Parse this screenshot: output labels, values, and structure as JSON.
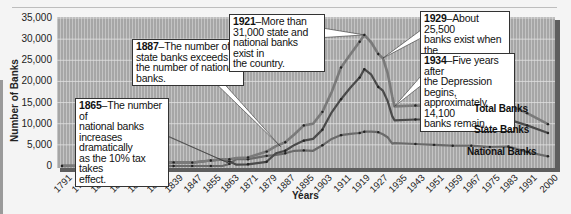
{
  "chart_data": {
    "type": "line",
    "title": "",
    "xlabel": "Years",
    "ylabel": "Number of Banks",
    "ylim": [
      0,
      35000
    ],
    "yticks": [
      "0",
      "5,000",
      "10,000",
      "15,000",
      "20,000",
      "25,000",
      "30,000",
      "35,000"
    ],
    "xticks": [
      "1791",
      "1799",
      "1807",
      "1815",
      "1823",
      "1831",
      "1839",
      "1847",
      "1855",
      "1863",
      "1871",
      "1879",
      "1887",
      "1895",
      "1903",
      "1911",
      "1919",
      "1927",
      "1935",
      "1943",
      "1951",
      "1959",
      "1967",
      "1975",
      "1983",
      "1991",
      "2000"
    ],
    "grid": true,
    "x": [
      1791,
      1799,
      1807,
      1815,
      1823,
      1831,
      1839,
      1847,
      1855,
      1860,
      1863,
      1866,
      1871,
      1879,
      1883,
      1887,
      1891,
      1895,
      1899,
      1903,
      1907,
      1911,
      1915,
      1919,
      1921,
      1924,
      1927,
      1929,
      1931,
      1933,
      1934,
      1943,
      1951,
      1959,
      1967,
      1975,
      1983,
      1991,
      2000
    ],
    "series": [
      {
        "name": "Total Banks",
        "values": [
          20,
          50,
          150,
          250,
          330,
          500,
          850,
          800,
          1300,
          1550,
          1600,
          1900,
          2000,
          3400,
          4700,
          5600,
          7500,
          9600,
          10000,
          12800,
          17500,
          23300,
          26400,
          29400,
          31000,
          29200,
          26500,
          25500,
          22000,
          16500,
          14100,
          14300,
          14200,
          14100,
          14200,
          14600,
          14500,
          12500,
          9900
        ]
      },
      {
        "name": "State Banks",
        "values": [
          20,
          50,
          150,
          250,
          330,
          500,
          850,
          800,
          1300,
          1550,
          1100,
          300,
          400,
          1000,
          3000,
          3600,
          5000,
          6000,
          6400,
          8600,
          12700,
          15800,
          18500,
          20900,
          22900,
          21600,
          18700,
          17800,
          15400,
          11800,
          10800,
          11000,
          11000,
          10900,
          11000,
          11200,
          11000,
          9600,
          7800
        ]
      },
      {
        "name": "National Banks",
        "values": [
          0,
          0,
          0,
          0,
          0,
          0,
          0,
          0,
          0,
          0,
          500,
          1600,
          1600,
          2400,
          2600,
          3000,
          3600,
          3700,
          3600,
          4900,
          6400,
          7300,
          7600,
          7800,
          8100,
          8100,
          8000,
          7500,
          6800,
          5300,
          5400,
          5200,
          5000,
          4800,
          4800,
          4500,
          4600,
          3300,
          2300
        ]
      }
    ],
    "annotations": [
      {
        "year": "1865",
        "text": "The number of national banks increases dramatically as the 10% tax takes effect."
      },
      {
        "year": "1887",
        "text": "The number of state banks exceeds the number of national banks."
      },
      {
        "year": "1921",
        "text": "More than 31,000 state and national banks exist in the country."
      },
      {
        "year": "1929",
        "text": "About 25,500 banks exist when the Depression starts."
      },
      {
        "year": "1934",
        "text": "Five years after the Depression begins, approximately 14,100 banks remain."
      }
    ]
  },
  "annotations": {
    "a1865": {
      "year": "1865",
      "line1": "–The number of",
      "line2": "national banks",
      "line3": "increases dramatically",
      "line4": "as the 10% tax takes",
      "line5": "effect."
    },
    "a1887": {
      "year": "1887",
      "line1": "–The number of",
      "line2": "state banks exceeds",
      "line3": "the number of national",
      "line4": "banks."
    },
    "a1921": {
      "year": "1921",
      "line1": "–More than",
      "line2": "31,000 state and",
      "line3": "national banks exist in",
      "line4": "the country."
    },
    "a1929": {
      "year": "1929",
      "line1": "–About 25,500",
      "line2": "banks exist when the",
      "line3": "Depression starts."
    },
    "a1934": {
      "year": "1934",
      "line1": "–Five years after",
      "line2": "the Depression begins,",
      "line3": "approximately 14,100",
      "line4": "banks remain."
    }
  },
  "labels": {
    "total": "Total Banks",
    "state": "State Banks",
    "national": "National Banks",
    "xaxis": "Years",
    "yaxis": "Number of Banks"
  },
  "colors": {
    "plot_bg": "#a9a9a9",
    "grid": "#d6d6d6",
    "total_line": "#7a7a7a",
    "state_line": "#4a4a4a",
    "national_line": "#6a6a6a",
    "marker": "#222222",
    "frame_shadow": "#5a5a5a"
  }
}
